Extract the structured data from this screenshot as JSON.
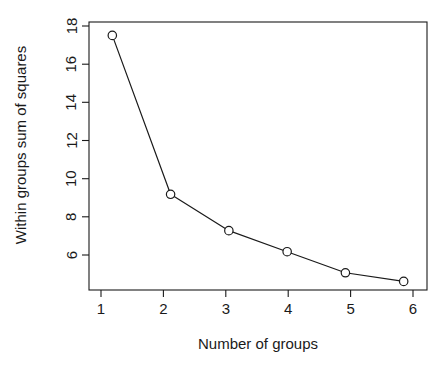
{
  "chart_data": {
    "type": "line",
    "title": "",
    "subtitle": "",
    "xlabel": "Number of groups",
    "ylabel": "Within groups sum of squares",
    "x": [
      1,
      2,
      3,
      4,
      5,
      6
    ],
    "values": [
      17.5,
      9.2,
      7.3,
      6.2,
      5.1,
      4.65
    ],
    "categories": [
      "1",
      "2",
      "3",
      "4",
      "5",
      "6"
    ],
    "series": [
      {
        "name": "Within groups sum of squares",
        "values": [
          17.5,
          9.2,
          7.3,
          6.2,
          5.1,
          4.65
        ]
      }
    ],
    "xlim": [
      0.6,
      6.4
    ],
    "ylim": [
      4.2,
      18.2
    ],
    "xticks": [
      1,
      2,
      3,
      4,
      5,
      6
    ],
    "xtick_labels": [
      "1",
      "2",
      "3",
      "4",
      "5",
      "6"
    ],
    "yticks": [
      6,
      8,
      10,
      12,
      14,
      16,
      18
    ],
    "ytick_labels": [
      "6",
      "8",
      "10",
      "12",
      "14",
      "16",
      "18"
    ],
    "grid": false,
    "legend": false,
    "legend_position": "none",
    "marker": "open-circle",
    "line_color": "#1a1a1a",
    "marker_fill": "#ffffff",
    "background": "#ffffff",
    "annotations": []
  },
  "figure": {
    "plot_area": {
      "left": 89,
      "right": 427,
      "top": 22,
      "bottom": 290
    }
  }
}
